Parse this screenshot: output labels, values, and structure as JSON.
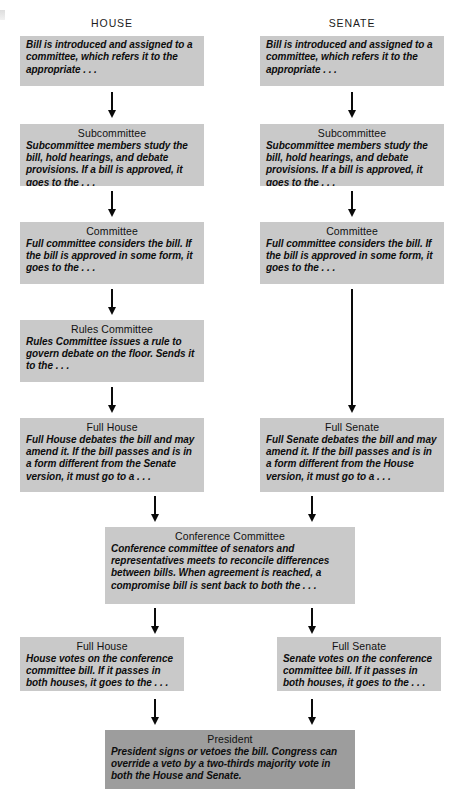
{
  "diagram": {
    "columns": [
      {
        "id": "house",
        "label": "HOUSE"
      },
      {
        "id": "senate",
        "label": "SENATE"
      }
    ],
    "colors": {
      "box_fill": "#c9c9c9",
      "box_fill_emphasis": "#9d9d9d",
      "text": "#111111",
      "arrow": "#0a0a0a",
      "background": "#ffffff"
    },
    "nodes": {
      "house_intro": {
        "title": "",
        "body": "Bill is introduced and assigned to a committee, which refers it to the appropriate . . ."
      },
      "senate_intro": {
        "title": "",
        "body": "Bill is introduced and assigned to a committee, which refers it to the appropriate . . ."
      },
      "house_subcommittee": {
        "title": "Subcommittee",
        "body": "Subcommittee members study the bill, hold hearings, and debate provisions. If a bill is approved, it goes to the . . ."
      },
      "senate_subcommittee": {
        "title": "Subcommittee",
        "body": "Subcommittee members study the bill, hold hearings, and debate provisions. If a bill is approved, it goes to the . . ."
      },
      "house_committee": {
        "title": "Committee",
        "body": "Full committee considers the bill. If the bill is approved in some form, it goes to the . . ."
      },
      "senate_committee": {
        "title": "Committee",
        "body": "Full committee considers the bill. If the bill is approved in some form, it goes to the . . ."
      },
      "rules_committee": {
        "title": "Rules Committee",
        "body": "Rules Committee issues a rule to govern debate on the floor. Sends it to the . . ."
      },
      "full_house_debate": {
        "title": "Full House",
        "body": "Full House debates the bill and may amend it. If the bill passes and is in a form different from the Senate version, it must go to a . . ."
      },
      "full_senate_debate": {
        "title": "Full Senate",
        "body": "Full Senate debates the bill and may amend it. If the bill passes and is in a form different from the House version, it must go to a . . ."
      },
      "conference_committee": {
        "title": "Conference Committee",
        "body": "Conference committee of senators and representatives meets to reconcile differences between bills. When agreement is reached, a compromise bill is sent back to both the . . ."
      },
      "full_house_vote": {
        "title": "Full House",
        "body": "House votes on the conference committee bill. If it passes in both houses, it goes to the . . ."
      },
      "full_senate_vote": {
        "title": "Full Senate",
        "body": "Senate votes on the conference committee bill. If it passes in both houses, it goes to the . . ."
      },
      "president": {
        "title": "President",
        "body": "President signs or vetoes the bill. Congress can override a veto by a two-thirds majority vote in both the House and Senate."
      }
    }
  }
}
